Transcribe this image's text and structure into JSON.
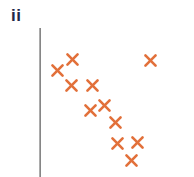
{
  "panel": {
    "label": "ii",
    "label_color": "#232747",
    "background": "#ffffff"
  },
  "axis": {
    "name": "y-axis-line",
    "color": "#454545",
    "x": 39,
    "y_top": 28,
    "y_bottom": 177,
    "thickness": 2,
    "has_ticks": false,
    "has_tick_labels": false,
    "x_axis_visible": false
  },
  "chart_data": {
    "type": "scatter",
    "title": "ii",
    "subtitle": "",
    "xlabel": "",
    "ylabel": "",
    "xlim": [
      0,
      194
    ],
    "ylim": [
      177,
      0
    ],
    "grid": false,
    "legend": null,
    "legend_position": "none",
    "marker": {
      "shape": "x",
      "color": "#E2703A",
      "size": 13,
      "stroke_width": 2.6
    },
    "annotations": [],
    "n_points": 11,
    "points": [
      {
        "x": 72,
        "y": 59
      },
      {
        "x": 57,
        "y": 70
      },
      {
        "x": 71,
        "y": 85
      },
      {
        "x": 92,
        "y": 85
      },
      {
        "x": 90,
        "y": 110
      },
      {
        "x": 104,
        "y": 105
      },
      {
        "x": 115,
        "y": 122
      },
      {
        "x": 117,
        "y": 143
      },
      {
        "x": 137,
        "y": 142
      },
      {
        "x": 131,
        "y": 160
      },
      {
        "x": 150,
        "y": 60
      }
    ]
  }
}
